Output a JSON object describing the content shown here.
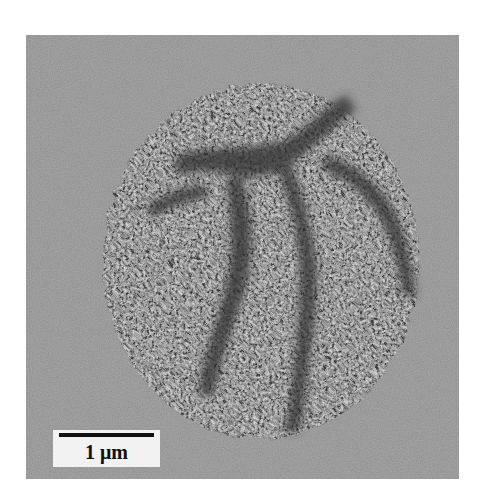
{
  "figure": {
    "type": "transmission electron micrograph",
    "background_color": "#8a8a8a",
    "particle_color": "#5a5a5a"
  },
  "scale_bar": {
    "label": "1 μm",
    "length_px": 95
  }
}
